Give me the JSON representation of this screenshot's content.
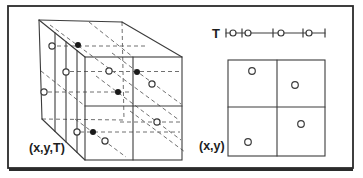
{
  "labels": {
    "cube": "(x,y,T)",
    "plane": "(x,y)",
    "time_axis": "T"
  },
  "colors": {
    "line": "#3c3c3c",
    "dash": "#707070",
    "text": "#1e1e1e",
    "background": "#ffffff",
    "point_fill": "#1a1a1a",
    "point_open": "#ffffff"
  },
  "diagram": {
    "border": {
      "x": 8,
      "y": 6,
      "w": 345,
      "h": 162
    },
    "cube": {
      "front_face": {
        "x": 85,
        "y": 57,
        "w": 97,
        "h": 103
      },
      "solid_edges": [
        [
          39,
          20,
          122,
          22
        ],
        [
          122,
          22,
          182,
          57
        ],
        [
          39,
          20,
          85,
          57
        ],
        [
          39,
          20,
          42,
          119
        ],
        [
          42,
          119,
          85,
          160
        ]
      ],
      "front_dividers": [
        [
          133,
          57,
          133,
          160
        ],
        [
          85,
          106,
          182,
          106
        ]
      ],
      "left_face_slice_lines": [
        [
          55,
          32.9,
          55,
          131.4
        ],
        [
          66,
          41.7,
          66,
          141.9
        ],
        [
          77,
          50.6,
          77,
          152.4
        ]
      ],
      "dashed_hidden_edges": [
        [
          122,
          22,
          124,
          120
        ],
        [
          42,
          119,
          124,
          120
        ],
        [
          89,
          22,
          133,
          57
        ],
        [
          41,
          71,
          85,
          106
        ]
      ],
      "dashed_horizontal_guides": [
        [
          57,
          46,
          148,
          46
        ],
        [
          70,
          71.5,
          180,
          71.5
        ],
        [
          48,
          92,
          131,
          92
        ],
        [
          120,
          122,
          181,
          122
        ],
        [
          80,
          132,
          180,
          132
        ]
      ],
      "dashed_depth_guides": [
        [
          50,
          25,
          179,
          120
        ],
        [
          112,
          53,
          181,
          104
        ],
        [
          96,
          76,
          181,
          140
        ],
        [
          75,
          119,
          126,
          157
        ],
        [
          130,
          111,
          185,
          152
        ]
      ],
      "filled_points": [
        [
          78,
          45
        ],
        [
          137,
          72
        ],
        [
          118,
          92
        ],
        [
          93,
          132
        ]
      ],
      "open_points": [
        [
          52,
          46
        ],
        [
          66,
          72
        ],
        [
          44,
          92
        ],
        [
          77,
          132
        ],
        [
          109,
          71
        ],
        [
          152,
          84
        ],
        [
          157,
          122
        ],
        [
          105,
          141
        ]
      ]
    },
    "timeline": {
      "y": 33,
      "x1": 226,
      "x2": 325,
      "tick_half_height": 4.5,
      "ticks": [
        226,
        242,
        273,
        303,
        325
      ],
      "points": [
        233,
        248,
        281,
        309
      ]
    },
    "plane": {
      "rect": {
        "x": 228,
        "y": 60,
        "w": 97,
        "h": 96
      },
      "dividers": [
        [
          277,
          60,
          277,
          156
        ],
        [
          228,
          107,
          325,
          107
        ]
      ],
      "points": [
        [
          252,
          71
        ],
        [
          295,
          85
        ],
        [
          301,
          124
        ],
        [
          248,
          142
        ]
      ]
    }
  }
}
